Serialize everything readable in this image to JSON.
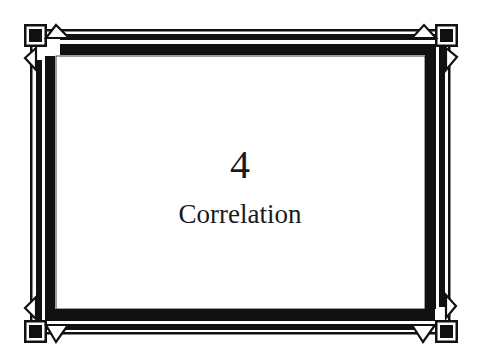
{
  "chapter": {
    "number": "4",
    "title": "Correlation"
  },
  "frame": {
    "style": "art-deco-border",
    "ink_color": "#111111",
    "paper_color": "#ffffff"
  }
}
